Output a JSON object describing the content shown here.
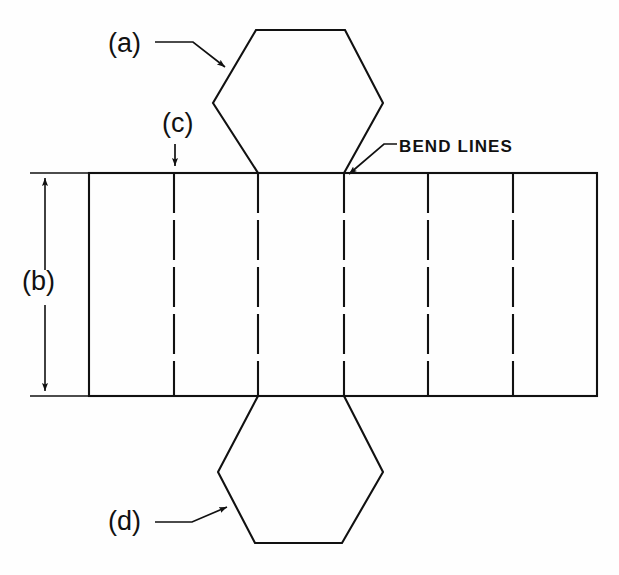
{
  "figure": {
    "type": "engineering-flat-pattern-diagram",
    "background_color": "#fefefe",
    "line_color": "#111111"
  },
  "labels": {
    "a": "(a)",
    "c": "(c)",
    "b": "(b)",
    "d": "(d)",
    "bend_lines": "BEND LINES"
  },
  "geometry": {
    "strip": {
      "left": 89,
      "right": 597,
      "top": 173,
      "bottom": 396,
      "panel_count": 6
    },
    "bend_line_x_positions": [
      174,
      258,
      344,
      428,
      513
    ],
    "dimension_b": {
      "axis_x": 45,
      "from_y": 173,
      "to_y": 396,
      "extension_left": 30,
      "extension_right": 95
    },
    "hexagon_top": {
      "vertices": [
        [
          256,
          30
        ],
        [
          345,
          30
        ],
        [
          383,
          103
        ],
        [
          344,
          173
        ],
        [
          258,
          173
        ],
        [
          213,
          103
        ]
      ]
    },
    "hexagon_bottom": {
      "vertices": [
        [
          258,
          396
        ],
        [
          344,
          396
        ],
        [
          383,
          472
        ],
        [
          342,
          543
        ],
        [
          255,
          543
        ],
        [
          218,
          472
        ]
      ]
    },
    "leader_a": {
      "points": [
        [
          155,
          42
        ],
        [
          193,
          42
        ],
        [
          228,
          70
        ]
      ]
    },
    "leader_c": {
      "points": [
        [
          175,
          146
        ],
        [
          175,
          170
        ]
      ]
    },
    "leader_d": {
      "points": [
        [
          155,
          522
        ],
        [
          192,
          522
        ],
        [
          230,
          505
        ]
      ]
    },
    "leader_bend": {
      "points": [
        [
          396,
          144
        ],
        [
          384,
          144
        ],
        [
          346,
          177
        ]
      ]
    }
  }
}
